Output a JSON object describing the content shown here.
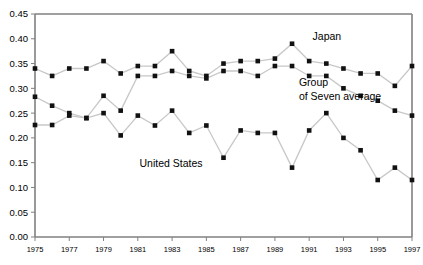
{
  "chart_data": {
    "type": "line",
    "title": "",
    "subtitle": "",
    "xlabel": "",
    "ylabel": "",
    "grid": false,
    "legend_position": "inline-annotations",
    "xlim": [
      1975,
      1997
    ],
    "ylim": [
      0.0,
      0.45
    ],
    "ytick_labels": [
      "0.45",
      "0.40",
      "0.35",
      "0.30",
      "0.25",
      "0.20",
      "0.15",
      "0.10",
      "0.05",
      "0.00"
    ],
    "ytick_values": [
      0.45,
      0.4,
      0.35,
      0.3,
      0.25,
      0.2,
      0.15,
      0.1,
      0.05,
      0.0
    ],
    "xtick_labels": [
      "1975",
      "1977",
      "1979",
      "1981",
      "1983",
      "1985",
      "1987",
      "1989",
      "1991",
      "1993",
      "1995",
      "1997"
    ],
    "xtick_values": [
      1975,
      1977,
      1979,
      1981,
      1983,
      1985,
      1987,
      1989,
      1991,
      1993,
      1995,
      1997
    ],
    "x": [
      1975,
      1976,
      1977,
      1978,
      1979,
      1980,
      1981,
      1982,
      1983,
      1984,
      1985,
      1986,
      1987,
      1988,
      1989,
      1990,
      1991,
      1992,
      1993,
      1994,
      1995,
      1996,
      1997
    ],
    "series": [
      {
        "name": "Japan",
        "label": "Japan",
        "values": [
          0.34,
          0.325,
          0.34,
          0.34,
          0.355,
          0.33,
          0.345,
          0.345,
          0.375,
          0.335,
          0.325,
          0.35,
          0.355,
          0.355,
          0.36,
          0.39,
          0.355,
          0.35,
          0.34,
          0.33,
          0.33,
          0.305,
          0.345
        ]
      },
      {
        "name": "Group of Seven average",
        "label": "Group of Seven average",
        "values": [
          0.283,
          0.265,
          0.25,
          0.24,
          0.285,
          0.255,
          0.325,
          0.325,
          0.335,
          0.325,
          0.32,
          0.335,
          0.335,
          0.325,
          0.345,
          0.345,
          0.325,
          0.325,
          0.3,
          0.285,
          0.275,
          0.255,
          0.245
        ]
      },
      {
        "name": "United States",
        "label": "United States",
        "values": [
          0.226,
          0.226,
          0.245,
          0.24,
          0.25,
          0.205,
          0.245,
          0.225,
          0.255,
          0.21,
          0.225,
          0.16,
          0.215,
          0.21,
          0.21,
          0.14,
          0.215,
          0.25,
          0.2,
          0.175,
          0.115,
          0.14,
          0.115
        ]
      }
    ],
    "annotations": [
      {
        "text": "Japan",
        "x": 1991.2,
        "y": 0.398
      },
      {
        "text": "Group",
        "x": 1990.4,
        "y": 0.305
      },
      {
        "text": "of Seven average",
        "x": 1990.4,
        "y": 0.277
      },
      {
        "text": "United States",
        "x": 1981.1,
        "y": 0.141
      }
    ],
    "colors": {
      "marker": "#111111",
      "line": "#c8c8c8",
      "axis": "#808080",
      "background": "#ffffff"
    }
  }
}
